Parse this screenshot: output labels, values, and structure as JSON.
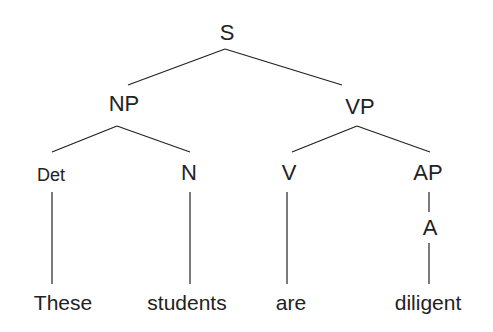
{
  "diagram": {
    "type": "syntax-tree",
    "nodes": {
      "S": "S",
      "NP": "NP",
      "VP": "VP",
      "Det": "Det",
      "N": "N",
      "V": "V",
      "AP": "AP",
      "A": "A"
    },
    "words": {
      "these": "These",
      "students": "students",
      "are": "are",
      "diligent": "diligent"
    },
    "line_color": "#222222"
  }
}
